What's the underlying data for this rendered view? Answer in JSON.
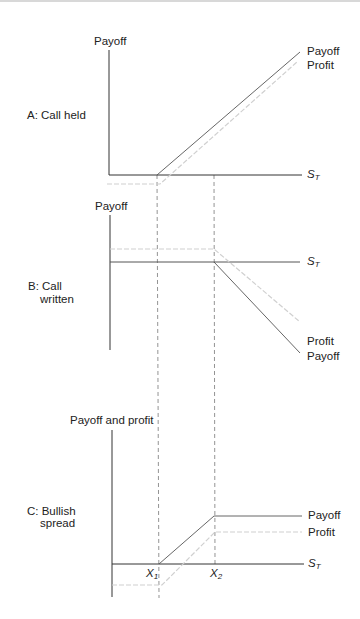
{
  "panels": {
    "A": {
      "title": "A: Call held",
      "y_axis_label": "Payoff",
      "x_axis_label": "S",
      "x_axis_sub": "T",
      "line_labels": [
        "Payoff",
        "Profit"
      ]
    },
    "B": {
      "title_line1": "B: Call",
      "title_line2": "written",
      "y_axis_label": "Payoff",
      "x_axis_label": "S",
      "x_axis_sub": "T",
      "line_labels": [
        "Profit",
        "Payoff"
      ]
    },
    "C": {
      "title_line1": "C: Bullish",
      "title_line2": "spread",
      "y_axis_label": "Payoff and profit",
      "x_axis_label": "S",
      "x_axis_sub": "T",
      "x1_label": "X",
      "x1_sub": "1",
      "x2_label": "X",
      "x2_sub": "2",
      "line_labels": [
        "Payoff",
        "Profit"
      ]
    }
  },
  "colors": {
    "axis": "#333333",
    "payoff_line": "#555555",
    "profit_line": "#d0d0d0",
    "guide_dash": "#777777"
  }
}
